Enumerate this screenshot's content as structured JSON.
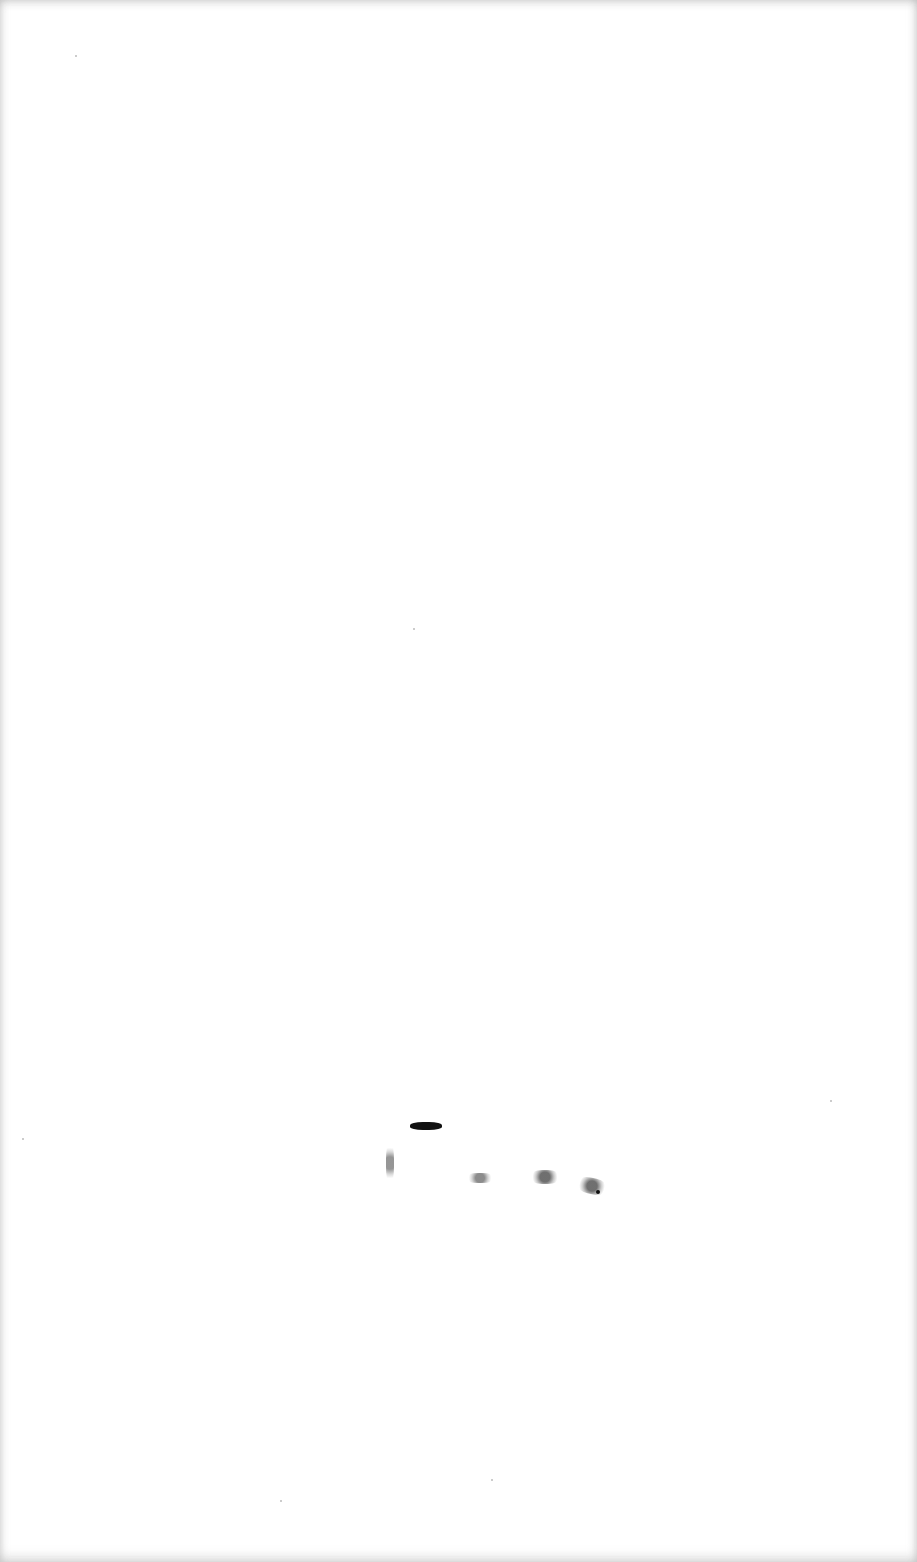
{
  "page": {
    "background": "#ffffff",
    "edge_shade": "#b0b0b0",
    "text": ""
  },
  "marks": [
    {
      "name": "ink-dash",
      "x": 410,
      "y": 1122,
      "w": 32,
      "h": 8
    },
    {
      "name": "speckle-vertical",
      "x": 386,
      "y": 1143,
      "w": 8,
      "h": 40
    },
    {
      "name": "speckle-1",
      "x": 466,
      "y": 1173,
      "w": 28,
      "h": 10
    },
    {
      "name": "speckle-2",
      "x": 530,
      "y": 1170,
      "w": 30,
      "h": 14
    },
    {
      "name": "speckle-3",
      "x": 577,
      "y": 1178,
      "w": 30,
      "h": 16
    }
  ]
}
